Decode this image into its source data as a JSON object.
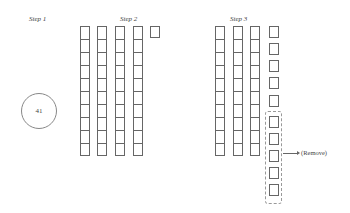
{
  "steps": [
    {
      "label": "Step 1"
    },
    {
      "label": "Step 2"
    },
    {
      "label": "Step 3"
    }
  ],
  "step1": {
    "circle_value": "41"
  },
  "step2": {
    "tens_columns": 4,
    "ones_units": 1,
    "rows_per_column": 10
  },
  "step3": {
    "tens_columns": 3,
    "ones_units": 10,
    "kept_units": 5,
    "removed_units": 5,
    "annotation": "(Remove)"
  }
}
